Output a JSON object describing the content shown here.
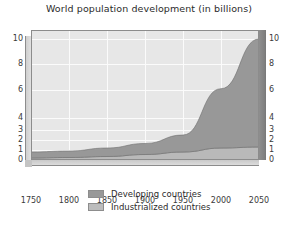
{
  "chart_data": {
    "type": "area",
    "stacked": true,
    "title": "World population development (in billions)",
    "subtitle": "",
    "xlabel": "",
    "ylabel": "",
    "xlim": [
      1750,
      2050
    ],
    "ylim": [
      0,
      10
    ],
    "y_axis_scale": "non-linear (compressed below 4)",
    "grid": true,
    "legend_position": "bottom-center",
    "x": [
      1750,
      1800,
      1850,
      1900,
      1950,
      2000,
      2050
    ],
    "xticks": [
      "1750",
      "1800",
      "1850",
      "1900",
      "1950",
      "2000",
      "2050"
    ],
    "yticks": [
      "0",
      "1",
      "2",
      "3",
      "4",
      "6",
      "8",
      "10"
    ],
    "yticks_right": [
      "0",
      "1",
      "2",
      "3",
      "4",
      "6",
      "8",
      "10"
    ],
    "series": [
      {
        "name": "Industrialized countries",
        "color": "#b9b9b9",
        "values": [
          0.2,
          0.25,
          0.35,
          0.55,
          0.8,
          1.2,
          1.3
        ]
      },
      {
        "name": "Developing countries",
        "color": "#989898",
        "values": [
          0.6,
          0.65,
          0.85,
          1.1,
          1.7,
          4.9,
          8.7
        ]
      }
    ],
    "totals": [
      0.8,
      0.9,
      1.2,
      1.65,
      2.5,
      6.1,
      10.0
    ],
    "annotations": []
  },
  "legend": {
    "items": [
      {
        "label": "Developing countries",
        "color": "#989898"
      },
      {
        "label": "Industrialized countries",
        "color": "#bcbcbc"
      }
    ]
  },
  "colors": {
    "plot_background": "#e7e7e7",
    "gridline": "#fbfbfb",
    "frame": "#8c8c8c",
    "developing": "#989898",
    "industrialized": "#b9b9b9",
    "text": "#2b2b2b",
    "page_background": "#ffffff"
  }
}
